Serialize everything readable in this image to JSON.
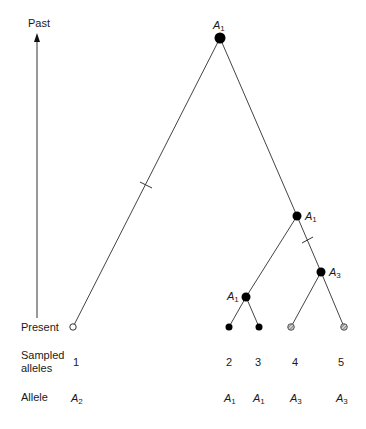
{
  "axis": {
    "top_label": "Past",
    "bottom_label": "Present"
  },
  "rows": {
    "sampled_label_line1": "Sampled",
    "sampled_label_line2": "alleles",
    "allele_label": "Allele"
  },
  "samples": [
    {
      "id": "1",
      "allele": "A",
      "allele_sub": "2",
      "state": "open"
    },
    {
      "id": "2",
      "allele": "A",
      "allele_sub": "1",
      "state": "filled"
    },
    {
      "id": "3",
      "allele": "A",
      "allele_sub": "1",
      "state": "filled"
    },
    {
      "id": "4",
      "allele": "A",
      "allele_sub": "3",
      "state": "hatched"
    },
    {
      "id": "5",
      "allele": "A",
      "allele_sub": "3",
      "state": "hatched"
    }
  ],
  "internal_nodes": {
    "root": {
      "allele": "A",
      "sub": "1"
    },
    "right_clade": {
      "allele": "A",
      "sub": "1"
    },
    "a3_clade": {
      "allele": "A",
      "sub": "3"
    },
    "a1_clade": {
      "allele": "A",
      "sub": "1"
    }
  },
  "colors": {
    "line": "#333333",
    "filled_node": "#000000",
    "open_node": "#ffffff",
    "hatched_node": "#9a9a9a"
  }
}
